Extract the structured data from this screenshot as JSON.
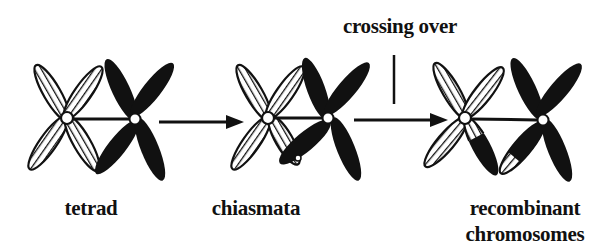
{
  "title": "crossing over",
  "stages": [
    {
      "id": "tetrad",
      "label": "tetrad"
    },
    {
      "id": "chiasmata",
      "label": "chiasmata"
    },
    {
      "id": "recombinant",
      "label_line1": "recombinant",
      "label_line2": "chromosomes"
    }
  ],
  "annotation": {
    "text": "crossing over"
  },
  "colors": {
    "ink": "#111111",
    "background": "#ffffff"
  },
  "legend": {
    "hatched": "hatched-chromosome",
    "solid": "solid-chromosome"
  }
}
